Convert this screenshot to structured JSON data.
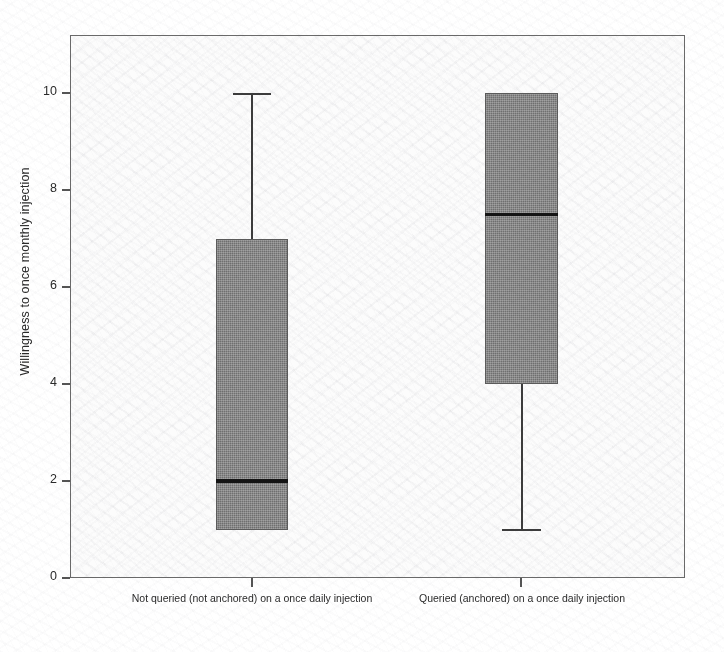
{
  "figure": {
    "background_color": "#ffffff",
    "plot_background_color": "#fcfcfc",
    "frame_color": "#6a6a6a",
    "box_fill_color": "#707070",
    "box_border_color": "#5b5b5b",
    "median_color": "#141414",
    "whisker_color": "#3c3c3c"
  },
  "axes": {
    "y_title": "Willingness to once monthly injection",
    "y_ticks": [
      "0",
      "2",
      "4",
      "6",
      "8",
      "10"
    ],
    "y_tick_values": [
      0,
      2,
      4,
      6,
      8,
      10
    ],
    "y_min": 0,
    "y_max": 11.2,
    "x_labels": [
      "Not queried (not anchored) on a once daily injection",
      "Queried (anchored) on a once daily injection"
    ]
  },
  "chart_data": {
    "type": "box",
    "title": "",
    "xlabel": "",
    "ylabel": "Willingness to once monthly injection",
    "ylim": [
      0,
      11.2
    ],
    "yticks": [
      0,
      2,
      4,
      6,
      8,
      10
    ],
    "grid": false,
    "legend": "none",
    "categories": [
      "Not queried (not anchored) on a once daily injection",
      "Queried (anchored) on a once daily injection"
    ],
    "boxes": [
      {
        "label": "Not queried (not anchored) on a once daily injection",
        "whisker_low": 1,
        "q1": 1,
        "median": 2,
        "q3": 7,
        "whisker_high": 10,
        "outliers": []
      },
      {
        "label": "Queried (anchored) on a once daily injection",
        "whisker_low": 1,
        "q1": 4,
        "median": 7.5,
        "q3": 10,
        "whisker_high": 10,
        "outliers": []
      }
    ]
  }
}
